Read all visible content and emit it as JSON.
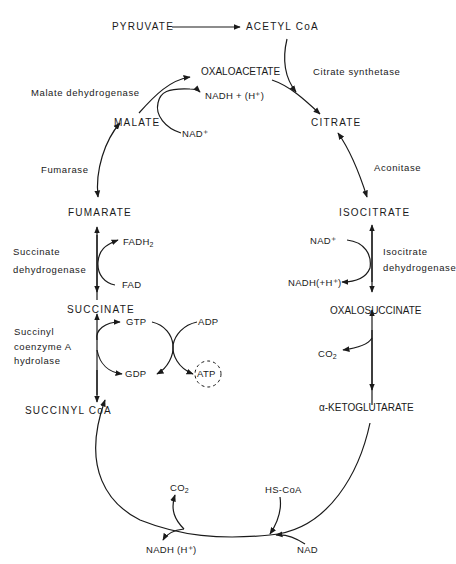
{
  "header": {
    "title": ""
  },
  "metabolites": {
    "pyruvate": "PYRUVATE",
    "acetyl_coa": "ACETYL CoA",
    "oxaloacetate": "OXALOACETATE",
    "citrate": "CITRATE",
    "isocitrate": "ISOCITRATE",
    "oxalosuccinate": "OXALOSUCCINATE",
    "alpha_ketoglutarate": "α-KETOGLUTARATE",
    "succinyl_coa": "SUCCINYL CoA",
    "succinate": "SUCCINATE",
    "fumarate": "FUMARATE",
    "malate": "MALATE"
  },
  "enzymes": {
    "citrate_synthetase": "Citrate synthetase",
    "aconitase": "Aconitase",
    "isocitrate_dh_line1": "Isocitrate",
    "isocitrate_dh_line2": "dehydrogenase",
    "succinyl_coa_hydrolase_line1": "Succinyl",
    "succinyl_coa_hydrolase_line2": "coenzyme A",
    "succinyl_coa_hydrolase_line3": "hydrolase",
    "succinate_dh_line1": "Succinate",
    "succinate_dh_line2": "dehydrogenase",
    "fumarase": "Fumarase",
    "malate_dh": "Malate dehydrogenase"
  },
  "cofactors": {
    "nadh_h_malate": "NADH + (H⁺)",
    "nad_plus_malate": "NAD⁺",
    "nad_plus_isocitrate": "NAD⁺",
    "nadh_h_isocitrate": "NADH(+H⁺)",
    "co2_oxalosuccinate": "CO",
    "co2_oxalosuccinate_sub": "2",
    "fadh2": "FADH",
    "fadh2_sub": "2",
    "fad": "FAD",
    "gtp": "GTP",
    "gdp": "GDP",
    "adp": "ADP",
    "atp": "ATP",
    "co2_bottom": "CO",
    "co2_bottom_sub": "2",
    "hs_coa": "HS-CoA",
    "nadh_h_bottom": "NADH (H⁺)",
    "nad_bottom": "NAD"
  }
}
